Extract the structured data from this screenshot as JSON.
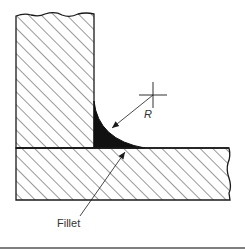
{
  "diagram": {
    "type": "technical-drawing",
    "labels": {
      "radius": "R",
      "fillet": "Fillet"
    },
    "colors": {
      "line": "#1a1a1a",
      "hatch": "#333333",
      "fillet_fill": "#111111",
      "background": "#ffffff",
      "bottom_rule": "#555555"
    },
    "parts": [
      {
        "name": "vertical-member",
        "hatched": true,
        "broken_edge": "top"
      },
      {
        "name": "horizontal-member",
        "hatched": true,
        "broken_edge": "right"
      },
      {
        "name": "fillet",
        "filled": true
      }
    ],
    "annotations": [
      {
        "name": "center-mark",
        "symbol": "crosshair"
      },
      {
        "name": "radius-dimension",
        "text": "R",
        "arrow": "points to fillet arc"
      },
      {
        "name": "fillet-leader",
        "text": "Fillet",
        "arrow": "points to fillet base"
      }
    ]
  }
}
